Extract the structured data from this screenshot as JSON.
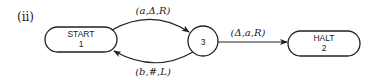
{
  "figure": {
    "part_label": "(ii)",
    "nodes": [
      {
        "id": "start",
        "line1": "START",
        "line2": "1",
        "shape": "pill"
      },
      {
        "id": "s3",
        "line1": "3",
        "shape": "circle"
      },
      {
        "id": "halt",
        "line1": "HALT",
        "line2": "2",
        "shape": "pill"
      }
    ],
    "edges": [
      {
        "from": "START 1",
        "to": "3",
        "label": "(a,Δ,R)"
      },
      {
        "from": "3",
        "to": "START 1",
        "label": "(b,#,L)"
      },
      {
        "from": "3",
        "to": "HALT 2",
        "label": "(Δ,a,R)"
      }
    ]
  }
}
